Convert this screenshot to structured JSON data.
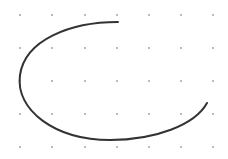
{
  "canvas": {
    "width": 228,
    "height": 159,
    "background": "#ffffff"
  },
  "grid": {
    "dot_color": "#9a9a9a",
    "dot_radius": 0.9,
    "xs": [
      20,
      52,
      85,
      117,
      149,
      181,
      213
    ],
    "ys": [
      15,
      48,
      81,
      114,
      147
    ]
  },
  "curve": {
    "label": "open arc",
    "stroke": "#333333",
    "stroke_width": 2,
    "path": "M 118 22 C 70 22, 25 40, 20 75 C 15 110, 55 140, 110 140 C 155 140, 195 125, 207 103"
  }
}
